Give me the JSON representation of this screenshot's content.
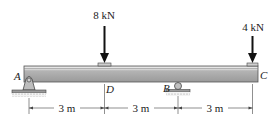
{
  "diagram": {
    "type": "beam",
    "loads": [
      {
        "label": "8 kN",
        "point": "D"
      },
      {
        "label": "4 kN",
        "point": "C"
      }
    ],
    "points": {
      "A": "A",
      "B": "B",
      "C": "C",
      "D": "D"
    },
    "supports": [
      {
        "point": "A",
        "type": "pin"
      },
      {
        "point": "B",
        "type": "roller"
      }
    ],
    "dimensions": [
      {
        "label": "3 m",
        "from": "A",
        "to": "D"
      },
      {
        "label": "3 m",
        "from": "D",
        "to": "B"
      },
      {
        "label": "3 m",
        "from": "B",
        "to": "C"
      }
    ],
    "colors": {
      "beam_top": "#e6e6e6",
      "beam_body": "#a8a8a8",
      "beam_edge": "#555555",
      "ink": "#222222"
    }
  }
}
